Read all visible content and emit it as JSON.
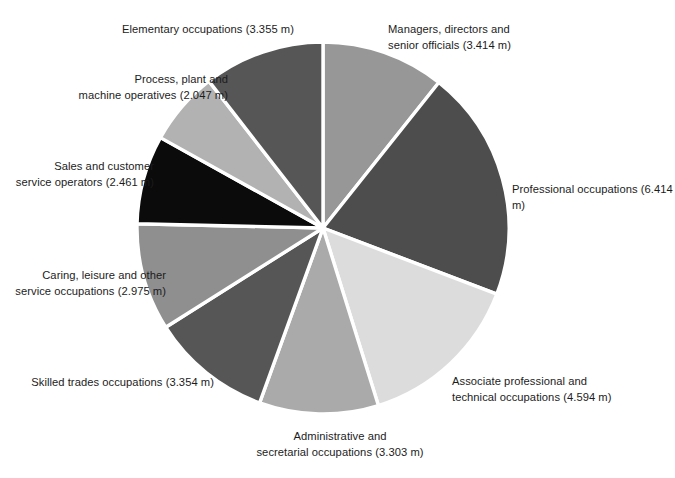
{
  "chart_data": {
    "type": "pie",
    "title": "",
    "subtitle": "",
    "xlabel": "",
    "ylabel": "",
    "unit": "m",
    "legend_position": "none",
    "grid": false,
    "total": 31.917,
    "start_angle_deg": 0,
    "direction": "clockwise",
    "categories": [
      "Managers, directors and senior officials",
      "Professional occupations",
      "Associate professional and technical occupations",
      "Administrative and secretarial occupations",
      "Skilled trades occupations",
      "Caring, leisure and other service occupations",
      "Sales and customer service operators",
      "Process, plant and machine operatives",
      "Elementary occupations"
    ],
    "values": [
      3.414,
      6.414,
      4.594,
      3.303,
      3.354,
      2.975,
      2.461,
      2.047,
      3.355
    ],
    "slices": [
      {
        "name": "managers",
        "label": "Managers, directors and\nsenior officials (3.414 m)",
        "value": 3.414,
        "color": "#979797",
        "label_align": "left"
      },
      {
        "name": "professional",
        "label": "Professional occupations (6.414 m)",
        "value": 6.414,
        "color": "#4d4d4d",
        "label_align": "left"
      },
      {
        "name": "associate",
        "label": "Associate professional and\ntechnical occupations (4.594 m)",
        "value": 4.594,
        "color": "#dcdcdc",
        "label_align": "left"
      },
      {
        "name": "administrative",
        "label": "Administrative and\nsecretarial occupations (3.303 m)",
        "value": 3.303,
        "color": "#aaaaaa",
        "label_align": "center"
      },
      {
        "name": "skilled-trades",
        "label": "Skilled trades occupations (3.354 m)",
        "value": 3.354,
        "color": "#565656",
        "label_align": "right"
      },
      {
        "name": "caring",
        "label": "Caring, leisure and other\nservice occupations (2.975 m)",
        "value": 2.975,
        "color": "#8f8f8f",
        "label_align": "right"
      },
      {
        "name": "sales",
        "label": "Sales and customer\nservice operators (2.461 m)",
        "value": 2.461,
        "color": "#0b0b0b",
        "label_align": "right"
      },
      {
        "name": "process-plant",
        "label": "Process, plant and\nmachine operatives (2.047 m)",
        "value": 2.047,
        "color": "#b2b2b2",
        "label_align": "right"
      },
      {
        "name": "elementary",
        "label": "Elementary occupations (3.355 m)",
        "value": 3.355,
        "color": "#565656",
        "label_align": "center"
      }
    ],
    "geometry": {
      "center_x": 323,
      "center_y": 228,
      "radius": 186,
      "separator_color": "#ffffff",
      "separator_width": 3.4
    },
    "background_color": "#ffffff",
    "text_color": "#1c1c1c"
  }
}
